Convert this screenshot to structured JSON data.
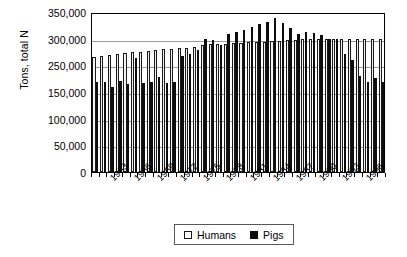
{
  "chart_data": {
    "type": "bar",
    "title": "",
    "subtitle": "",
    "xlabel": "",
    "ylabel": "Tons, total N",
    "ylim": [
      0,
      350000
    ],
    "grid": true,
    "legend_position": "bottom-center",
    "y_tick_labels": [
      "350,000",
      "300,000",
      "250,000",
      "150,000",
      "100,000",
      "50,000",
      "0"
    ],
    "y_tick_values": [
      350000,
      300000,
      250000,
      200000,
      150000,
      100000,
      50000,
      0
    ],
    "x_tick_labels": [
      "1963",
      "1966",
      "1969",
      "1972",
      "1975",
      "1978",
      "1981",
      "1984",
      "1987",
      "1990",
      "1993",
      "1996"
    ],
    "categories": [
      "1961",
      "1962",
      "1963",
      "1964",
      "1965",
      "1966",
      "1967",
      "1968",
      "1969",
      "1970",
      "1971",
      "1972",
      "1973",
      "1974",
      "1975",
      "1976",
      "1977",
      "1978",
      "1979",
      "1980",
      "1981",
      "1982",
      "1983",
      "1984",
      "1985",
      "1986",
      "1987",
      "1988",
      "1989",
      "1990",
      "1991",
      "1992",
      "1993",
      "1994",
      "1995",
      "1996",
      "1997",
      "1998"
    ],
    "series": [
      {
        "name": "Humans",
        "color": "#f2f2f2",
        "edge_color": "#1a1a1a",
        "values": [
          252000,
          254000,
          256000,
          259000,
          261000,
          262000,
          263000,
          265000,
          267000,
          269000,
          270000,
          271000,
          272000,
          274000,
          277000,
          279000,
          280000,
          281000,
          282000,
          283000,
          284000,
          285000,
          285000,
          286000,
          287000,
          288000,
          289000,
          290000,
          290000,
          290000,
          291000,
          291000,
          291000,
          291000,
          292000,
          292000,
          292000,
          292000
        ]
      },
      {
        "name": "Pigs",
        "color": "#0d0d0d",
        "edge_color": "#0d0d0d",
        "values": [
          196000,
          196000,
          186000,
          199000,
          192000,
          250000,
          194000,
          196000,
          207000,
          194000,
          197000,
          253000,
          259000,
          266000,
          291000,
          288000,
          278000,
          301000,
          307000,
          310000,
          317000,
          324000,
          329000,
          336000,
          326000,
          315000,
          303000,
          307000,
          304000,
          299000,
          292000,
          292000,
          258000,
          246000,
          210000,
          196000,
          206000,
          198000
        ]
      }
    ]
  },
  "legend": {
    "entries": [
      {
        "label": "Humans",
        "swatch": "open-square-swatch"
      },
      {
        "label": "Pigs",
        "swatch": "filled-square-swatch"
      }
    ]
  }
}
